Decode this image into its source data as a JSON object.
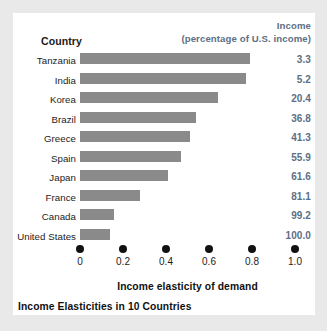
{
  "header": {
    "country_label": "Country",
    "income_line1": "Income",
    "income_line2": "(percentage of U.S. income)"
  },
  "axis": {
    "title": "Income elasticity of demand",
    "ticks": [
      "0",
      "0.2",
      "0.4",
      "0.6",
      "0.8",
      "1.0"
    ]
  },
  "caption": "Income Elasticities in 10 Countries",
  "colors": {
    "bar": "#8a8a8a",
    "value_text": "#5d6f84",
    "label_text": "#1c1c1c",
    "card_background": "#ffffff",
    "page_background": "#e9e9e9"
  },
  "chart_data": {
    "type": "bar",
    "orientation": "horizontal",
    "title": "Income Elasticities in 10 Countries",
    "xlabel": "Income elasticity of demand",
    "ylabel": "Country",
    "xlim": [
      0,
      1.0
    ],
    "xticks": [
      0,
      0.2,
      0.4,
      0.6,
      0.8,
      1.0
    ],
    "grid": false,
    "legend": false,
    "categories": [
      "Tanzania",
      "India",
      "Korea",
      "Brazil",
      "Greece",
      "Spain",
      "Japan",
      "France",
      "Canada",
      "United States"
    ],
    "values": [
      0.79,
      0.77,
      0.64,
      0.54,
      0.51,
      0.47,
      0.41,
      0.28,
      0.16,
      0.14
    ],
    "annotation_column": {
      "name": "Income (percentage of U.S. income)",
      "values": [
        "3.3",
        "5.2",
        "20.4",
        "36.8",
        "41.3",
        "55.9",
        "61.6",
        "81.1",
        "99.2",
        "100.0"
      ]
    },
    "rows": [
      {
        "country": "Tanzania",
        "elasticity": 0.79,
        "income_pct": "3.3"
      },
      {
        "country": "India",
        "elasticity": 0.77,
        "income_pct": "5.2"
      },
      {
        "country": "Korea",
        "elasticity": 0.64,
        "income_pct": "20.4"
      },
      {
        "country": "Brazil",
        "elasticity": 0.54,
        "income_pct": "36.8"
      },
      {
        "country": "Greece",
        "elasticity": 0.51,
        "income_pct": "41.3"
      },
      {
        "country": "Spain",
        "elasticity": 0.47,
        "income_pct": "55.9"
      },
      {
        "country": "Japan",
        "elasticity": 0.41,
        "income_pct": "61.6"
      },
      {
        "country": "France",
        "elasticity": 0.28,
        "income_pct": "81.1"
      },
      {
        "country": "Canada",
        "elasticity": 0.16,
        "income_pct": "99.2"
      },
      {
        "country": "United States",
        "elasticity": 0.14,
        "income_pct": "100.0"
      }
    ]
  }
}
